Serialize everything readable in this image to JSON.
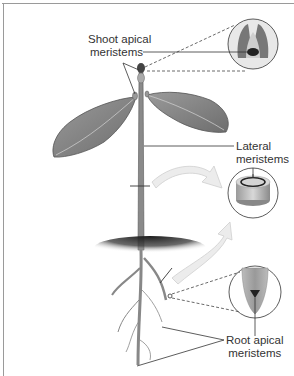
{
  "diagram": {
    "labels": {
      "shoot_apical_line1": "Shoot apical",
      "shoot_apical_line2": "meristems",
      "lateral_line1": "Lateral",
      "lateral_line2": "meristems",
      "root_apical_line1": "Root apical",
      "root_apical_line2": "meristems"
    },
    "callouts": [
      {
        "name": "shoot-tip-detail",
        "depicts": "cross-section of shoot apex"
      },
      {
        "name": "stem-cross-section",
        "depicts": "cylindrical stem segment with lateral meristem ring"
      },
      {
        "name": "root-tip-detail",
        "depicts": "root tip with apical meristem"
      }
    ],
    "colors": {
      "line": "#333333",
      "leaf": "#8a8a8a",
      "soil": "#222222",
      "arrow": "#e6e6e6"
    }
  }
}
